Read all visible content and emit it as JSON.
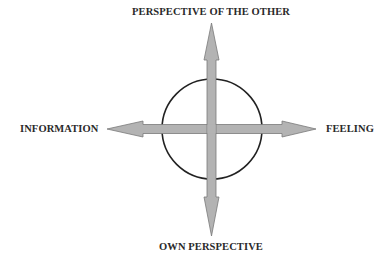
{
  "diagram": {
    "labels": {
      "top": "PERSPECTIVE OF THE OTHER",
      "bottom": "OWN PERSPECTIVE",
      "left": "INFORMATION",
      "right": "FEELING"
    },
    "colors": {
      "arrow_fill": "#b3b3b3",
      "arrow_stroke": "#7a7a7a",
      "circle_stroke": "#222222",
      "text": "#2a2a2a"
    }
  }
}
